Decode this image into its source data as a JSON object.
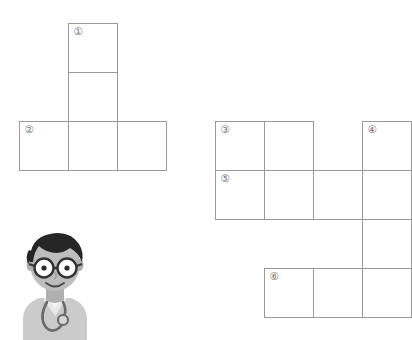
{
  "puzzle": {
    "title": "crossword-grid",
    "cell_size": 49,
    "columns": 8,
    "rows": 6,
    "grid_origin": {
      "x": 19,
      "y": 23
    },
    "border_color": "#9a9a9a",
    "cell_fill": "#ffffff",
    "number_color": "#6f6f6f",
    "cells": [
      {
        "col": 1,
        "row": 0,
        "number": "①"
      },
      {
        "col": 1,
        "row": 1,
        "number": ""
      },
      {
        "col": 0,
        "row": 2,
        "number": "②"
      },
      {
        "col": 1,
        "row": 2,
        "number": ""
      },
      {
        "col": 2,
        "row": 2,
        "number": ""
      },
      {
        "col": 4,
        "row": 2,
        "number": "③"
      },
      {
        "col": 5,
        "row": 2,
        "number": ""
      },
      {
        "col": 7,
        "row": 2,
        "number": "④"
      },
      {
        "col": 4,
        "row": 3,
        "number": "⑤"
      },
      {
        "col": 5,
        "row": 3,
        "number": ""
      },
      {
        "col": 6,
        "row": 3,
        "number": ""
      },
      {
        "col": 7,
        "row": 3,
        "number": ""
      },
      {
        "col": 7,
        "row": 4,
        "number": ""
      },
      {
        "col": 5,
        "row": 5,
        "number": "⑥"
      },
      {
        "col": 6,
        "row": 5,
        "number": ""
      },
      {
        "col": 7,
        "row": 5,
        "number": ""
      }
    ],
    "clue_numbers": [
      "①",
      "②",
      "③",
      "④",
      "⑤",
      "⑥"
    ]
  },
  "illustration": {
    "name": "doctor-character",
    "description": "cartoon doctor with glasses and stethoscope",
    "colors": {
      "hair": "#2b2b2b",
      "skin": "#b9b9b9",
      "coat": "#cfcfcf",
      "shirt": "#e6e6e6",
      "stethoscope": "#6a6a6a",
      "lens": "#fdfdfd",
      "frame": "#3a3a3a"
    }
  }
}
